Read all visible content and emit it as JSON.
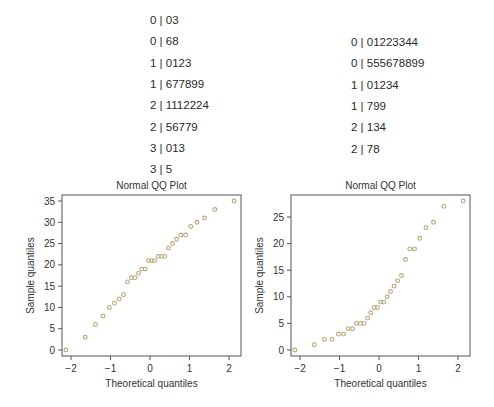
{
  "stem_leaf_left": {
    "rows": [
      "0 | 03",
      "0 | 68",
      "1 | 0123",
      "1 | 677899",
      "2 | 1112224",
      "2 | 56779",
      "3 | 013",
      "3 | 5"
    ]
  },
  "stem_leaf_right": {
    "rows": [
      "0 | 01223344",
      "0 | 555678899",
      "1 | 01234",
      "1 | 799",
      "2 | 134",
      "2 | 78"
    ]
  },
  "point_color": "#b8a77a",
  "chart_data": [
    {
      "type": "scatter",
      "title": "Normal QQ Plot",
      "xlabel": "Theoretical quantiles",
      "ylabel": "Sample quantiles",
      "xticks": [
        -2,
        -1,
        0,
        1,
        2
      ],
      "yticks": [
        0,
        5,
        10,
        15,
        20,
        25,
        30,
        35
      ],
      "xlim": [
        -2.28,
        2.28
      ],
      "ylim": [
        -1.3,
        36.3
      ],
      "grid": false,
      "x": [
        -2.13,
        -1.64,
        -1.38,
        -1.19,
        -1.03,
        -0.9,
        -0.78,
        -0.67,
        -0.57,
        -0.47,
        -0.38,
        -0.29,
        -0.21,
        -0.12,
        -0.04,
        0.04,
        0.12,
        0.21,
        0.29,
        0.38,
        0.47,
        0.57,
        0.67,
        0.78,
        0.9,
        1.03,
        1.19,
        1.38,
        1.64,
        2.13
      ],
      "y": [
        0,
        3,
        6,
        8,
        10,
        11,
        12,
        13,
        16,
        17,
        17,
        18,
        19,
        19,
        21,
        21,
        21,
        22,
        22,
        22,
        24,
        25,
        26,
        27,
        27,
        29,
        30,
        31,
        33,
        35
      ]
    },
    {
      "type": "scatter",
      "title": "Normal QQ Plot",
      "xlabel": "Theoretical quantiles",
      "ylabel": "Sample quantiles",
      "xticks": [
        -2,
        -1,
        0,
        1,
        2
      ],
      "yticks": [
        0,
        5,
        10,
        15,
        20,
        25
      ],
      "xlim": [
        -2.28,
        2.28
      ],
      "ylim": [
        -1.1,
        29.0
      ],
      "grid": false,
      "x": [
        -2.13,
        -1.64,
        -1.38,
        -1.19,
        -1.03,
        -0.9,
        -0.78,
        -0.67,
        -0.57,
        -0.47,
        -0.38,
        -0.29,
        -0.21,
        -0.12,
        -0.04,
        0.04,
        0.12,
        0.21,
        0.29,
        0.38,
        0.47,
        0.57,
        0.67,
        0.78,
        0.9,
        1.03,
        1.19,
        1.38,
        1.64,
        2.13
      ],
      "y": [
        0,
        1,
        2,
        2,
        3,
        3,
        4,
        4,
        5,
        5,
        5,
        6,
        7,
        8,
        8,
        9,
        9,
        10,
        11,
        12,
        13,
        14,
        17,
        19,
        19,
        21,
        23,
        24,
        27,
        28
      ]
    }
  ]
}
